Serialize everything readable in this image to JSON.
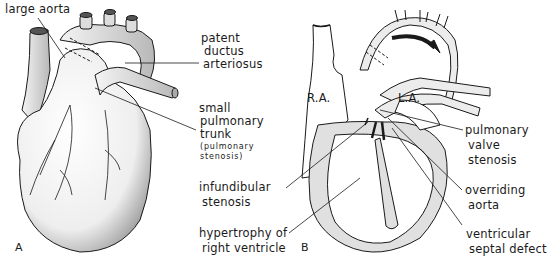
{
  "figure": {
    "panels": [
      {
        "id": "A",
        "letter": "A",
        "description": "External anterior view of heart",
        "labels": {
          "large_aorta": "large aorta",
          "patent_ductus_1": "patent",
          "patent_ductus_2": "ductus",
          "patent_ductus_3": "arteriosus",
          "small_pulm_1": "small",
          "small_pulm_2": "pulmonary",
          "small_pulm_3": "trunk",
          "small_pulm_paren_1": "(pulmonary",
          "small_pulm_paren_2": "stenosis)"
        }
      },
      {
        "id": "B",
        "letter": "B",
        "description": "Sectional view of heart",
        "labels": {
          "ra": "R.A.",
          "la": "L.A.",
          "infundibular_1": "infundibular",
          "infundibular_2": "stenosis",
          "hypertrophy_1": "hypertrophy of",
          "hypertrophy_2": "right ventricle",
          "pulm_valve_1": "pulmonary",
          "pulm_valve_2": "valve",
          "pulm_valve_3": "stenosis",
          "overriding_1": "overriding",
          "overriding_2": "aorta",
          "vsd_1": "ventricular",
          "vsd_2": "septal defect"
        }
      }
    ]
  },
  "colors": {
    "ink": "#1a1a1a",
    "shade": "#d9d9d9",
    "background": "#ffffff"
  }
}
